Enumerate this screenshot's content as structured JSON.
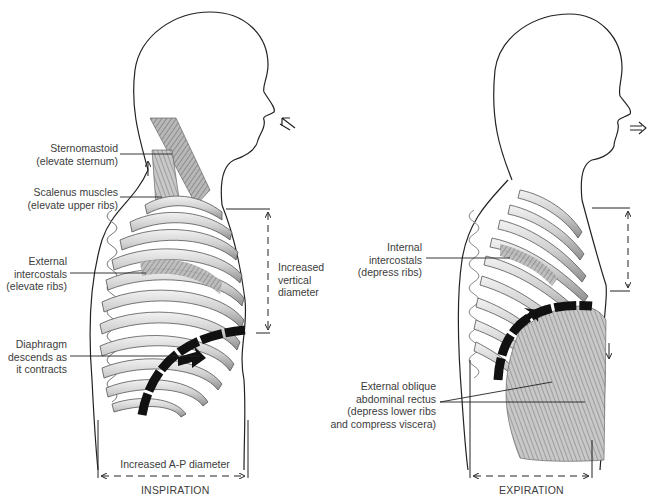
{
  "figure": {
    "panels": [
      {
        "id": "inspiration",
        "caption": "INSPIRATION",
        "labels": {
          "sternomastoid": [
            "Sternomastoid",
            "(elevate sternum)"
          ],
          "scalenus": [
            "Scalenus muscles",
            "(elevate upper ribs)"
          ],
          "external_intercostals": [
            "External",
            "intercostals",
            "(elevate ribs)"
          ],
          "diaphragm": [
            "Diaphragm",
            "descends as",
            "it contracts"
          ],
          "vertical_diameter": [
            "Increased",
            "vertical",
            "diameter"
          ],
          "ap_diameter": "Increased A-P diameter"
        },
        "airflow": "inhale-arrow"
      },
      {
        "id": "expiration",
        "caption": "EXPIRATION",
        "labels": {
          "internal_intercostals": [
            "Internal",
            "intercostals",
            "(depress ribs)"
          ],
          "abdominal": [
            "External oblique",
            "abdominal rectus",
            "(depress lower ribs",
            "and compress viscera)"
          ]
        },
        "airflow": "exhale-arrow"
      }
    ],
    "colors": {
      "line": "#222222",
      "bone": "#d8d8d8",
      "muscle": "#8a8a8a",
      "diaphragm": "#111111",
      "text": "#3c3c3c"
    }
  }
}
